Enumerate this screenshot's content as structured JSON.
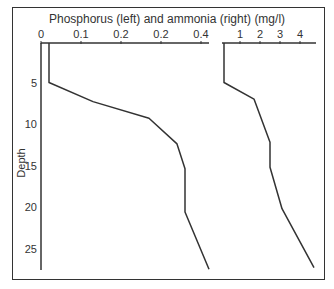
{
  "chart_data": {
    "type": "line",
    "title": "Phosphorus (left) and ammonia (right) (mg/l)",
    "ylabel": "Depth",
    "y_axis": {
      "ticks": [
        5,
        10,
        15,
        20,
        25
      ],
      "range": [
        0,
        28
      ],
      "inverted": true
    },
    "panels": [
      {
        "name": "Phosphorus",
        "x_ticks": [
          "0",
          "0.1",
          "0.2",
          "0.2",
          "0.4"
        ],
        "x_tick_values": [
          0,
          0.1,
          0.2,
          0.3,
          0.4
        ],
        "xlim": [
          0,
          0.43
        ],
        "points": [
          {
            "depth": 0,
            "value": 0.02
          },
          {
            "depth": 5,
            "value": 0.02
          },
          {
            "depth": 7.3,
            "value": 0.13
          },
          {
            "depth": 9.3,
            "value": 0.27
          },
          {
            "depth": 12.4,
            "value": 0.34
          },
          {
            "depth": 15.4,
            "value": 0.36
          },
          {
            "depth": 20.6,
            "value": 0.36
          },
          {
            "depth": 27.5,
            "value": 0.42
          }
        ]
      },
      {
        "name": "Ammonia",
        "x_ticks": [
          "1",
          "2",
          "3",
          "4"
        ],
        "x_tick_values": [
          1,
          2,
          3,
          4
        ],
        "xlim": [
          0,
          4.8
        ],
        "points": [
          {
            "depth": 0,
            "value": 0.2
          },
          {
            "depth": 5,
            "value": 0.2
          },
          {
            "depth": 7.0,
            "value": 1.7
          },
          {
            "depth": 12.2,
            "value": 2.5
          },
          {
            "depth": 15.2,
            "value": 2.5
          },
          {
            "depth": 20.2,
            "value": 3.1
          },
          {
            "depth": 27.3,
            "value": 4.7
          }
        ]
      }
    ],
    "grid": false,
    "legend": null
  }
}
